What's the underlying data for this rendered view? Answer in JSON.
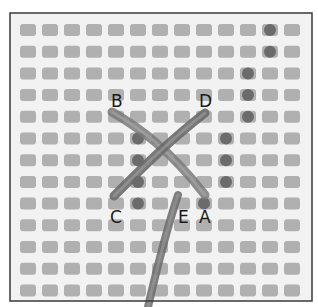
{
  "figure": {
    "frame": {
      "x": 10,
      "y": 13,
      "width": 302,
      "height": 288,
      "border_color": "#3a3a3a"
    },
    "canvas": {
      "background": "#f2f2f2",
      "hole_color": "#9a9a9a",
      "cols": 13,
      "rows": 13,
      "origin_x": 20,
      "origin_y": 24,
      "pitch_x": 22,
      "pitch_y": 21.7,
      "hole_w": 16,
      "hole_h": 12
    },
    "yarn_color": "#6e6e6e",
    "labels": [
      {
        "text": "B",
        "x": 111,
        "y": 93
      },
      {
        "text": "D",
        "x": 199,
        "y": 93
      },
      {
        "text": "C",
        "x": 110,
        "y": 209
      },
      {
        "text": "E",
        "x": 178,
        "y": 209
      },
      {
        "text": "A",
        "x": 199,
        "y": 209
      }
    ]
  }
}
